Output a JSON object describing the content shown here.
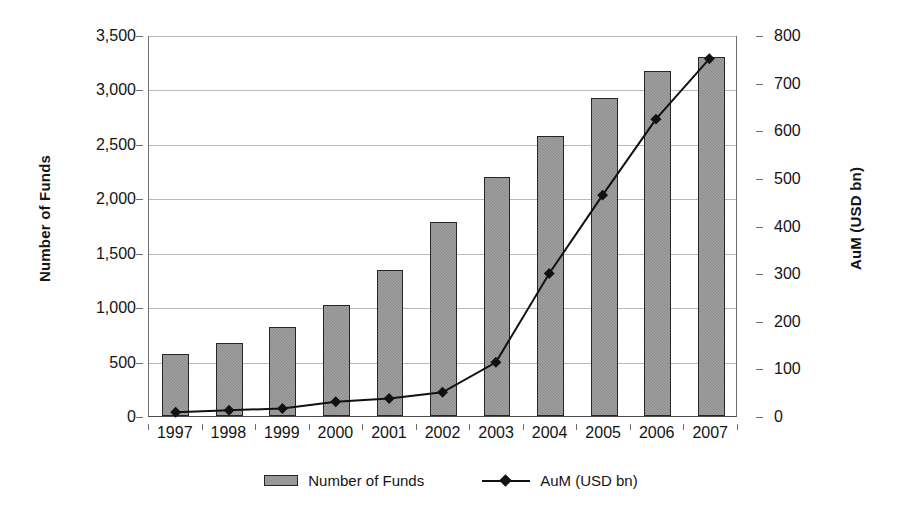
{
  "chart_data": {
    "type": "bar",
    "title": "",
    "subtitle": "",
    "xlabel": "",
    "ylabel": "Number of Funds",
    "y2label": "AuM (USD bn)",
    "categories": [
      "1997",
      "1998",
      "1999",
      "2000",
      "2001",
      "2002",
      "2003",
      "2004",
      "2005",
      "2006",
      "2007"
    ],
    "ylim": [
      0,
      3500
    ],
    "ytick_step": 500,
    "ytick_labels": [
      "0",
      "500",
      "1,000",
      "1,500",
      "2,000",
      "2,500",
      "3,000",
      "3,500"
    ],
    "ytick_values": [
      0,
      500,
      1000,
      1500,
      2000,
      2500,
      3000,
      3500
    ],
    "y2lim": [
      0,
      800
    ],
    "y2tick_step": 100,
    "y2tick_labels": [
      "0",
      "100",
      "200",
      "300",
      "400",
      "500",
      "600",
      "700",
      "800"
    ],
    "y2tick_values": [
      0,
      100,
      200,
      300,
      400,
      500,
      600,
      700,
      800
    ],
    "grid": true,
    "legend_position": "bottom",
    "series": [
      {
        "name": "Number of Funds",
        "type": "bar",
        "axis": "left",
        "color": "#8a8a8a",
        "edge_color": "#262626",
        "values": [
          570,
          675,
          820,
          1020,
          1340,
          1780,
          2200,
          2570,
          2925,
          3170,
          3300
        ]
      },
      {
        "name": "AuM (USD bn)",
        "type": "line",
        "axis": "right",
        "color": "#111111",
        "marker": "diamond",
        "values": [
          8,
          12,
          16,
          30,
          37,
          50,
          113,
          300,
          465,
          625,
          752
        ]
      }
    ]
  },
  "legend": {
    "items": [
      {
        "label": "Number of Funds",
        "swatch": "bar-swatch"
      },
      {
        "label": "AuM (USD bn)",
        "swatch": "line-marker-swatch"
      }
    ]
  },
  "axes": {
    "left_title": "Number of Funds",
    "right_title": "AuM (USD bn)"
  }
}
